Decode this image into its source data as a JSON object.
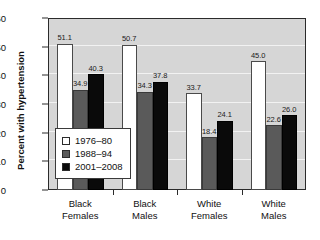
{
  "chart_data": {
    "type": "bar",
    "title": "",
    "subtitle": "",
    "xlabel": "",
    "ylabel": "Percent with hypertension",
    "ylim": [
      0,
      60
    ],
    "yticks": [
      0,
      10,
      20,
      30,
      40,
      50,
      60
    ],
    "grid": true,
    "legend_position": "inside-left",
    "categories": [
      "Black Females",
      "Black Males",
      "White Females",
      "White Males"
    ],
    "category_lines": [
      [
        "Black",
        "Females"
      ],
      [
        "Black",
        "Males"
      ],
      [
        "White",
        "Females"
      ],
      [
        "White",
        "Males"
      ]
    ],
    "series": [
      {
        "name": "1976–80",
        "color": "#ffffff",
        "values": [
          51.1,
          50.7,
          33.7,
          45.0
        ],
        "labels": [
          "51.1",
          "50.7",
          "33.7",
          "45.0"
        ]
      },
      {
        "name": "1988–94",
        "color": "#5a5a5a",
        "values": [
          34.9,
          34.3,
          18.4,
          22.6
        ],
        "labels": [
          "34.9",
          "34.3",
          "18.4",
          "22.6"
        ]
      },
      {
        "name": "2001–2008",
        "color": "#0a0a0a",
        "values": [
          40.3,
          37.8,
          24.1,
          26.0
        ],
        "labels": [
          "40.3",
          "37.8",
          "24.1",
          "26.0"
        ]
      }
    ]
  },
  "legend": {
    "items": [
      {
        "label": "1976–80",
        "swatch": "white"
      },
      {
        "label": "1988–94",
        "swatch": "gray"
      },
      {
        "label": "2001–2008",
        "swatch": "black"
      }
    ]
  },
  "axes": {
    "y_title": "Percent with hypertension",
    "y_tick_labels": [
      "0",
      "10",
      "20",
      "30",
      "40",
      "50",
      "60"
    ]
  },
  "colors": {
    "plot_background": "#d6d6d6",
    "gridline": "#f2f2f2",
    "frame": "#2b2b2b",
    "series_1976_80": "#ffffff",
    "series_1988_94": "#5a5a5a",
    "series_2001_2008": "#0a0a0a",
    "text": "#111111"
  }
}
